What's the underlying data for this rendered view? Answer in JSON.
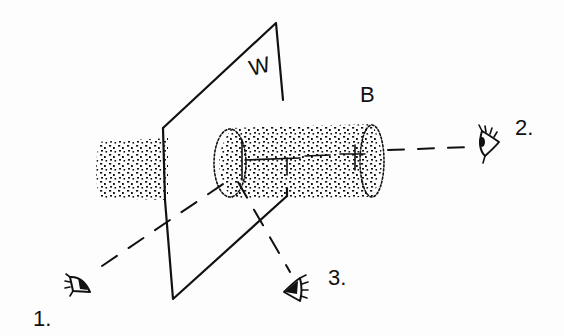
{
  "diagram": {
    "type": "perspective-sketch",
    "colors": {
      "ink": "#111111",
      "paper": "#fdfdfd"
    },
    "labels": {
      "wall": "W",
      "bar": "B",
      "viewer_1": "1.",
      "viewer_2": "2.",
      "viewer_3": "3."
    },
    "elements": [
      {
        "id": "wall",
        "label": "W",
        "shape": "parallelogram plane"
      },
      {
        "id": "bar-left-stub",
        "shape": "stippled cylinder segment behind wall"
      },
      {
        "id": "bar",
        "label": "B",
        "shape": "stippled cylinder passing through wall"
      },
      {
        "id": "eye-1",
        "label": "1.",
        "sight_line": "dashed toward cylinder end at wall"
      },
      {
        "id": "eye-2",
        "label": "2.",
        "sight_line": "dashed along cylinder axis"
      },
      {
        "id": "eye-3",
        "label": "3.",
        "sight_line": "dashed from below toward cylinder"
      }
    ]
  }
}
